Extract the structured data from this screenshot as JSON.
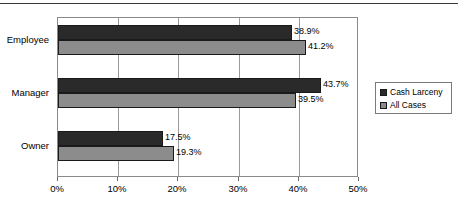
{
  "chart_data": {
    "type": "bar",
    "orientation": "horizontal",
    "title": "",
    "subtitle": "",
    "xlabel": "",
    "ylabel": "",
    "categories": [
      "Employee",
      "Manager",
      "Owner"
    ],
    "series": [
      {
        "name": "Cash Larceny",
        "color": "#2a2a2a",
        "values": [
          38.9,
          41.2,
          17.5
        ],
        "labels": [
          "38.9%",
          "43.7%",
          "17.5%"
        ]
      },
      {
        "name": "All Cases",
        "color": "#8c8c8c",
        "values": [
          41.2,
          39.5,
          19.3
        ],
        "labels": [
          "41.2%",
          "39.5%",
          "19.3%"
        ]
      }
    ],
    "data_by_category": [
      {
        "category": "Employee",
        "cash_larceny": 38.9,
        "all_cases": 41.2
      },
      {
        "category": "Manager",
        "cash_larceny": 43.7,
        "all_cases": 39.5
      },
      {
        "category": "Owner",
        "cash_larceny": 17.5,
        "all_cases": 19.3
      }
    ],
    "xlim": [
      0,
      50
    ],
    "xticks": [
      0,
      10,
      20,
      30,
      40,
      50
    ],
    "xtick_labels": [
      "0%",
      "10%",
      "20%",
      "30%",
      "40%",
      "50%"
    ],
    "grid": true,
    "grid_axis": "x",
    "legend_position": "right",
    "value_labels_shown": true
  },
  "legend": {
    "entries": [
      {
        "label": "Cash Larceny",
        "swatch": "dark-square-marker"
      },
      {
        "label": "All Cases",
        "swatch": "gray-square-marker"
      }
    ]
  },
  "axis": {
    "x_tick_labels": [
      "0%",
      "10%",
      "20%",
      "30%",
      "40%",
      "50%"
    ]
  },
  "bars": [
    {
      "category": "Employee",
      "series": "Cash Larceny",
      "value": 38.9,
      "label": "38.9%"
    },
    {
      "category": "Employee",
      "series": "All Cases",
      "value": 41.2,
      "label": "41.2%"
    },
    {
      "category": "Manager",
      "series": "Cash Larceny",
      "value": 43.7,
      "label": "43.7%"
    },
    {
      "category": "Manager",
      "series": "All Cases",
      "value": 39.5,
      "label": "39.5%"
    },
    {
      "category": "Owner",
      "series": "Cash Larceny",
      "value": 17.5,
      "label": "17.5%"
    },
    {
      "category": "Owner",
      "series": "All Cases",
      "value": 19.3,
      "label": "19.3%"
    }
  ],
  "category_labels": [
    "Employee",
    "Manager",
    "Owner"
  ],
  "colors": {
    "series_cash_larceny": "#2a2a2a",
    "series_all_cases": "#8c8c8c",
    "plot_border": "#8a8a8a",
    "gridline": "#9a9a9a",
    "text": "#000000",
    "top_rule": "#3a3a3a"
  }
}
